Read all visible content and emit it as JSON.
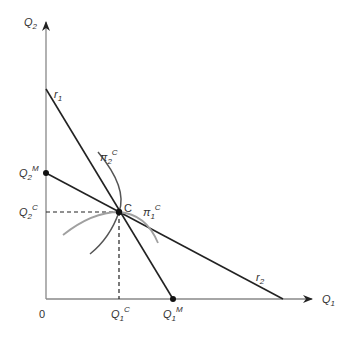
{
  "diagram": {
    "axes": {
      "y_label": "Q",
      "y_label_sub": "2",
      "x_label": "Q",
      "x_label_sub": "1",
      "origin_label": "0"
    },
    "lines": {
      "r1_label": "r",
      "r1_sub": "1",
      "r2_label": "r",
      "r2_sub": "2"
    },
    "curves": {
      "pi2_label": "π",
      "pi2_sub": "2",
      "pi2_sup": "C",
      "pi1_label": "π",
      "pi1_sub": "1",
      "pi1_sup": "C"
    },
    "points": {
      "equilibrium_label": "C",
      "q2m_label": "Q",
      "q2m_sub": "2",
      "q2m_sup": "M",
      "q2c_label": "Q",
      "q2c_sub": "2",
      "q2c_sup": "C",
      "q1c_label": "Q",
      "q1c_sub": "1",
      "q1c_sup": "C",
      "q1m_label": "Q",
      "q1m_sub": "1",
      "q1m_sup": "M"
    },
    "colors": {
      "axis": "#888888",
      "line": "#222222",
      "pi2_curve": "#555555",
      "pi1_curve": "#a0a0a0",
      "text": "#333333"
    }
  }
}
